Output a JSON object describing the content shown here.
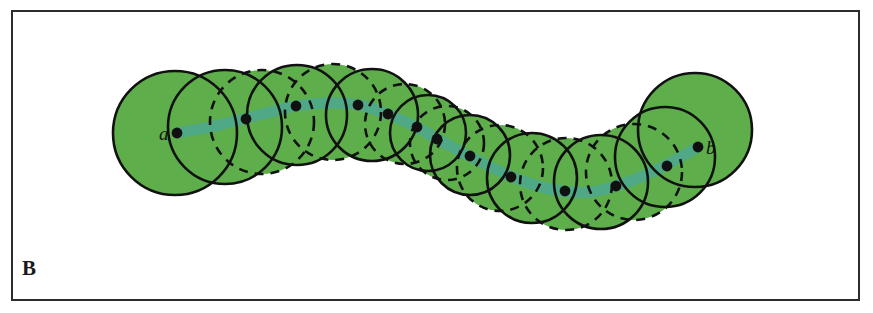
{
  "figure": {
    "panel_label": "B",
    "endpoint_start_label": "a",
    "endpoint_end_label": "b",
    "background_color": "#ffffff",
    "frame_color": "#2c2c2c",
    "disk_fill_color": "#5eaf4c",
    "disk_stroke_color": "#111111",
    "curve_color": "#4fa886",
    "center_dot_color": "#101010"
  },
  "chart_data": {
    "type": "scatter",
    "title": "",
    "subtitle": "",
    "xlabel": "",
    "ylabel": "",
    "xlim": [
      0,
      873
    ],
    "ylim": [
      0,
      313
    ],
    "grid": false,
    "legend_position": "none",
    "annotations": [
      {
        "text": "B",
        "x": 22,
        "y": 268,
        "role": "panel-label"
      },
      {
        "text": "a",
        "x": 162,
        "y": 136,
        "role": "endpoint-label"
      },
      {
        "text": "b",
        "x": 707,
        "y": 150,
        "role": "endpoint-label"
      }
    ],
    "series": [
      {
        "name": "covering disks",
        "type": "circles",
        "note": "Overlapping disks centred on the medial path; stroke alternates solid and dashed.",
        "fields": [
          "cx",
          "cy",
          "r",
          "stroke"
        ],
        "values": [
          [
            175,
            133,
            62,
            "solid"
          ],
          [
            225,
            127,
            57,
            "solid"
          ],
          [
            262,
            122,
            52,
            "dashed"
          ],
          [
            297,
            115,
            50,
            "solid"
          ],
          [
            333,
            112,
            48,
            "dashed"
          ],
          [
            372,
            115,
            46,
            "solid"
          ],
          [
            405,
            124,
            40,
            "dashed"
          ],
          [
            428,
            133,
            38,
            "solid"
          ],
          [
            447,
            143,
            37,
            "dashed"
          ],
          [
            470,
            155,
            40,
            "solid"
          ],
          [
            500,
            168,
            43,
            "dashed"
          ],
          [
            532,
            178,
            45,
            "solid"
          ],
          [
            566,
            184,
            46,
            "dashed"
          ],
          [
            601,
            182,
            47,
            "solid"
          ],
          [
            634,
            172,
            48,
            "dashed"
          ],
          [
            665,
            157,
            50,
            "solid"
          ],
          [
            695,
            130,
            57,
            "solid"
          ]
        ]
      },
      {
        "name": "path centres",
        "type": "points",
        "fields": [
          "x",
          "y"
        ],
        "values": [
          [
            177,
            133
          ],
          [
            246,
            119
          ],
          [
            296,
            106
          ],
          [
            358,
            105
          ],
          [
            388,
            114
          ],
          [
            417,
            127
          ],
          [
            437,
            139
          ],
          [
            470,
            156
          ],
          [
            511,
            177
          ],
          [
            565,
            191
          ],
          [
            616,
            186
          ],
          [
            667,
            166
          ],
          [
            698,
            147
          ]
        ]
      },
      {
        "name": "medial curve",
        "type": "line",
        "fields": [
          "x",
          "y"
        ],
        "values": [
          [
            177,
            133
          ],
          [
            215,
            126
          ],
          [
            255,
            116
          ],
          [
            296,
            106
          ],
          [
            330,
            103
          ],
          [
            360,
            105
          ],
          [
            390,
            115
          ],
          [
            420,
            129
          ],
          [
            450,
            146
          ],
          [
            485,
            164
          ],
          [
            520,
            180
          ],
          [
            555,
            190
          ],
          [
            590,
            192
          ],
          [
            625,
            183
          ],
          [
            660,
            168
          ],
          [
            698,
            147
          ]
        ]
      }
    ]
  }
}
